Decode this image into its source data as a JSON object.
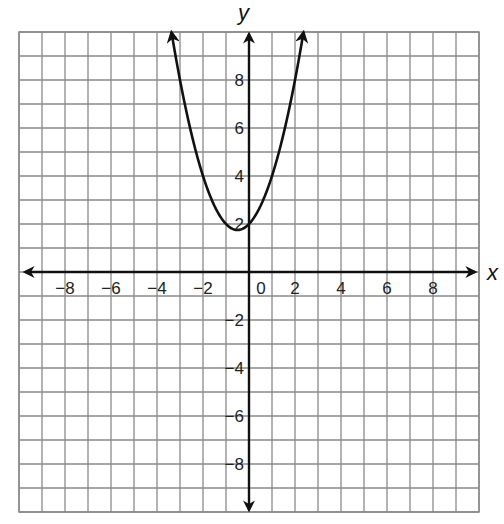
{
  "chart_data": {
    "type": "line",
    "title": "",
    "xlabel": "x",
    "ylabel": "y",
    "xlim": [
      -10,
      10
    ],
    "ylim": [
      -10,
      10
    ],
    "grid": true,
    "grid_step": 1,
    "legend": null,
    "x_tick_labels": [
      "-8",
      "-6",
      "-4",
      "-2",
      "0",
      "2",
      "4",
      "6",
      "8"
    ],
    "y_tick_labels": [
      "8",
      "6",
      "4",
      "2",
      "-2",
      "-4",
      "-6",
      "-8"
    ],
    "series": [
      {
        "name": "parabola",
        "equation": "y = x^2 + x + 2",
        "coefficients": {
          "a": 1,
          "b": 1,
          "c": 2
        },
        "vertex": [
          -0.5,
          1.75
        ],
        "x_range": [
          -3.37,
          2.37
        ],
        "arrows_at_ends": true,
        "points": [
          {
            "x": -3.37,
            "y": 10
          },
          {
            "x": -3,
            "y": 8
          },
          {
            "x": -2,
            "y": 4
          },
          {
            "x": -1,
            "y": 2
          },
          {
            "x": -0.5,
            "y": 1.75
          },
          {
            "x": 0,
            "y": 2
          },
          {
            "x": 1,
            "y": 4
          },
          {
            "x": 2,
            "y": 8
          },
          {
            "x": 2.37,
            "y": 10
          }
        ]
      }
    ]
  },
  "labels": {
    "x_axis": "x",
    "y_axis": "y",
    "x_ticks": [
      {
        "text": "−8",
        "value": -8
      },
      {
        "text": "−6",
        "value": -6
      },
      {
        "text": "−4",
        "value": -4
      },
      {
        "text": "−2",
        "value": -2
      },
      {
        "text": "0",
        "value": 0
      },
      {
        "text": "2",
        "value": 2
      },
      {
        "text": "4",
        "value": 4
      },
      {
        "text": "6",
        "value": 6
      },
      {
        "text": "8",
        "value": 8
      }
    ],
    "y_ticks": [
      {
        "text": "8",
        "value": 8
      },
      {
        "text": "6",
        "value": 6
      },
      {
        "text": "4",
        "value": 4
      },
      {
        "text": "2",
        "value": 2
      },
      {
        "text": "−2",
        "value": -2
      },
      {
        "text": "−4",
        "value": -4
      },
      {
        "text": "−6",
        "value": -6
      },
      {
        "text": "−8",
        "value": -8
      }
    ]
  },
  "colors": {
    "grid": "#8a8a8a",
    "axis": "#111111",
    "curve": "#111111",
    "background": "#ffffff"
  }
}
